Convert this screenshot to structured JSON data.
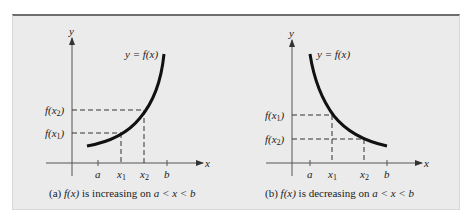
{
  "figure": {
    "panel_background": "#ebebeb",
    "border_color": "#6e6e6e",
    "curve_color": "#111111",
    "axis_color": "#333333"
  },
  "panels": [
    {
      "id": "a",
      "curve_label": "y = f(x)",
      "y_axis_label": "y",
      "x_axis_label": "x",
      "x_ticks": [
        "a",
        "x1",
        "x2",
        "b"
      ],
      "y_ticks": [
        "f(x2)",
        "f(x1)"
      ],
      "caption_prefix": "(a) ",
      "caption_func": "f(x)",
      "caption_mid": " is increasing on ",
      "caption_range": "a < x < b"
    },
    {
      "id": "b",
      "curve_label": "y = f(x)",
      "y_axis_label": "y",
      "x_axis_label": "x",
      "x_ticks": [
        "a",
        "x1",
        "x2",
        "b"
      ],
      "y_ticks": [
        "f(x1)",
        "f(x2)"
      ],
      "caption_prefix": "(b) ",
      "caption_func": "f(x)",
      "caption_mid": " is decreasing on ",
      "caption_range": "a < x < b"
    }
  ]
}
